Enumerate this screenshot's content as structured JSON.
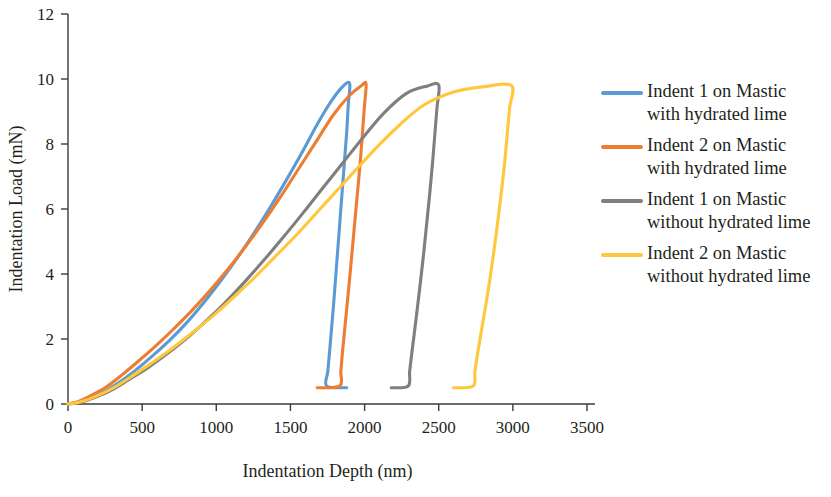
{
  "chart_data": {
    "type": "line",
    "title": "",
    "xlabel": "Indentation Depth (nm)",
    "ylabel": "Indentation Load (mN)",
    "xlim": [
      0,
      3500
    ],
    "ylim": [
      0,
      12
    ],
    "xticks": [
      "0",
      "500",
      "1000",
      "1500",
      "2000",
      "2500",
      "3000",
      "3500"
    ],
    "yticks": [
      "0",
      "2",
      "4",
      "6",
      "8",
      "10",
      "12"
    ],
    "grid": false,
    "legend_position": "right",
    "series": [
      {
        "name": "Indent 1 on Mastic with hydrated lime",
        "label_line1": "Indent 1 on Mastic",
        "label_line2": "with hydrated lime",
        "color": "#5B9BD5",
        "peak_load": 9.85,
        "peak_depth": 1900,
        "residual_depth": 1880,
        "loading": [
          [
            0,
            0
          ],
          [
            60,
            0.05
          ],
          [
            130,
            0.15
          ],
          [
            220,
            0.32
          ],
          [
            330,
            0.62
          ],
          [
            450,
            1.02
          ],
          [
            570,
            1.48
          ],
          [
            690,
            1.98
          ],
          [
            810,
            2.55
          ],
          [
            930,
            3.2
          ],
          [
            1040,
            3.85
          ],
          [
            1150,
            4.55
          ],
          [
            1260,
            5.3
          ],
          [
            1370,
            6.1
          ],
          [
            1480,
            6.95
          ],
          [
            1580,
            7.75
          ],
          [
            1680,
            8.6
          ],
          [
            1780,
            9.35
          ],
          [
            1860,
            9.8
          ],
          [
            1900,
            9.85
          ]
        ],
        "unloading": [
          [
            1900,
            9.85
          ],
          [
            1890,
            9.2
          ],
          [
            1880,
            8.4
          ],
          [
            1865,
            7.5
          ],
          [
            1850,
            6.6
          ],
          [
            1835,
            5.7
          ],
          [
            1820,
            4.8
          ],
          [
            1805,
            3.9
          ],
          [
            1790,
            3.0
          ],
          [
            1775,
            2.2
          ],
          [
            1762,
            1.5
          ],
          [
            1752,
            1.0
          ],
          [
            1745,
            0.55
          ],
          [
            1880,
            0.5
          ]
        ]
      },
      {
        "name": "Indent 2 on Mastic with hydrated lime",
        "label_line1": "Indent 2 on Mastic",
        "label_line2": "with hydrated lime",
        "color": "#ED7D31",
        "peak_load": 9.85,
        "peak_depth": 2010,
        "residual_depth": 1680,
        "loading": [
          [
            0,
            0
          ],
          [
            70,
            0.08
          ],
          [
            150,
            0.25
          ],
          [
            250,
            0.5
          ],
          [
            360,
            0.88
          ],
          [
            470,
            1.3
          ],
          [
            590,
            1.78
          ],
          [
            710,
            2.3
          ],
          [
            830,
            2.85
          ],
          [
            950,
            3.45
          ],
          [
            1070,
            4.1
          ],
          [
            1190,
            4.8
          ],
          [
            1310,
            5.55
          ],
          [
            1430,
            6.35
          ],
          [
            1550,
            7.2
          ],
          [
            1670,
            8.05
          ],
          [
            1790,
            8.9
          ],
          [
            1900,
            9.5
          ],
          [
            1980,
            9.8
          ],
          [
            2010,
            9.85
          ]
        ],
        "unloading": [
          [
            2010,
            9.85
          ],
          [
            1998,
            9.1
          ],
          [
            1985,
            8.3
          ],
          [
            1970,
            7.4
          ],
          [
            1952,
            6.5
          ],
          [
            1934,
            5.6
          ],
          [
            1916,
            4.7
          ],
          [
            1898,
            3.8
          ],
          [
            1880,
            2.95
          ],
          [
            1864,
            2.2
          ],
          [
            1850,
            1.55
          ],
          [
            1840,
            1.0
          ],
          [
            1832,
            0.55
          ],
          [
            1680,
            0.5
          ]
        ]
      },
      {
        "name": "Indent 1 on Mastic without hydrated lime",
        "label_line1": "Indent 1 on Mastic",
        "label_line2": "without hydrated lime",
        "color": "#7F7F7F",
        "peak_load": 9.82,
        "peak_depth": 2500,
        "residual_depth": 2180,
        "loading": [
          [
            0,
            0
          ],
          [
            80,
            0.05
          ],
          [
            180,
            0.2
          ],
          [
            290,
            0.42
          ],
          [
            410,
            0.75
          ],
          [
            540,
            1.12
          ],
          [
            670,
            1.55
          ],
          [
            800,
            2.02
          ],
          [
            930,
            2.55
          ],
          [
            1060,
            3.12
          ],
          [
            1190,
            3.75
          ],
          [
            1320,
            4.42
          ],
          [
            1450,
            5.12
          ],
          [
            1580,
            5.85
          ],
          [
            1710,
            6.6
          ],
          [
            1850,
            7.4
          ],
          [
            1990,
            8.2
          ],
          [
            2130,
            8.95
          ],
          [
            2280,
            9.55
          ],
          [
            2420,
            9.78
          ],
          [
            2500,
            9.82
          ]
        ],
        "unloading": [
          [
            2500,
            9.82
          ],
          [
            2488,
            9.1
          ],
          [
            2474,
            8.3
          ],
          [
            2458,
            7.4
          ],
          [
            2440,
            6.5
          ],
          [
            2420,
            5.6
          ],
          [
            2400,
            4.7
          ],
          [
            2378,
            3.8
          ],
          [
            2356,
            2.95
          ],
          [
            2336,
            2.2
          ],
          [
            2318,
            1.55
          ],
          [
            2304,
            1.0
          ],
          [
            2294,
            0.55
          ],
          [
            2180,
            0.5
          ]
        ]
      },
      {
        "name": "Indent 2 on Mastic without hydrated lime",
        "label_line1": "Indent 2 on Mastic",
        "label_line2": "without hydrated lime",
        "color": "#FFC73B",
        "peak_load": 9.8,
        "peak_depth": 2990,
        "residual_depth": 2600,
        "loading": [
          [
            0,
            0
          ],
          [
            80,
            0.06
          ],
          [
            180,
            0.22
          ],
          [
            300,
            0.48
          ],
          [
            430,
            0.85
          ],
          [
            560,
            1.25
          ],
          [
            700,
            1.7
          ],
          [
            840,
            2.2
          ],
          [
            980,
            2.72
          ],
          [
            1120,
            3.3
          ],
          [
            1260,
            3.9
          ],
          [
            1400,
            4.55
          ],
          [
            1540,
            5.2
          ],
          [
            1680,
            5.9
          ],
          [
            1820,
            6.6
          ],
          [
            1960,
            7.3
          ],
          [
            2100,
            7.98
          ],
          [
            2240,
            8.6
          ],
          [
            2400,
            9.2
          ],
          [
            2600,
            9.6
          ],
          [
            2800,
            9.76
          ],
          [
            2990,
            9.8
          ]
        ],
        "unloading": [
          [
            2990,
            9.8
          ],
          [
            2978,
            9.1
          ],
          [
            2962,
            8.3
          ],
          [
            2944,
            7.4
          ],
          [
            2922,
            6.5
          ],
          [
            2898,
            5.6
          ],
          [
            2872,
            4.7
          ],
          [
            2844,
            3.8
          ],
          [
            2814,
            2.95
          ],
          [
            2786,
            2.2
          ],
          [
            2762,
            1.55
          ],
          [
            2744,
            1.0
          ],
          [
            2732,
            0.55
          ],
          [
            2600,
            0.5
          ]
        ]
      }
    ]
  }
}
